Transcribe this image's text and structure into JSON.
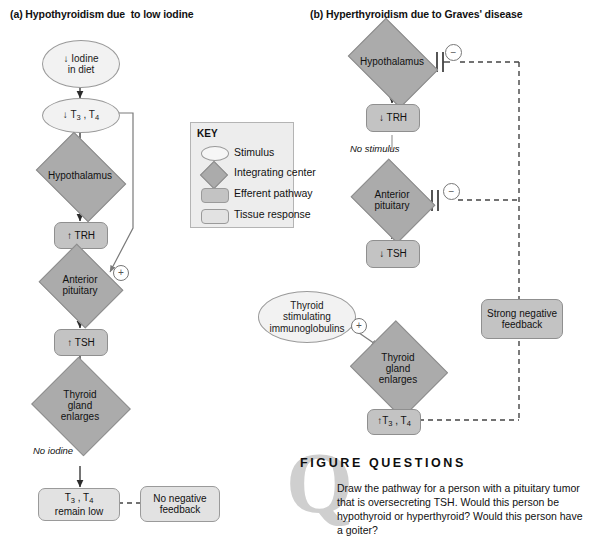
{
  "figure": {
    "panel_a_title": "(a) Hypothyroidism due  to low iodine",
    "panel_b_title": "(b) Hyperthyroidism due to Graves' disease"
  },
  "key": {
    "title": "KEY",
    "items": [
      {
        "shape": "ellipse",
        "label": "Stimulus"
      },
      {
        "shape": "diamond",
        "label": "Integrating center"
      },
      {
        "shape": "rounded-rect-dark",
        "label": "Efferent pathway"
      },
      {
        "shape": "rounded-rect-light",
        "label": "Tissue response"
      }
    ]
  },
  "panel_a": {
    "nodes": [
      {
        "name": "iodine-in-diet",
        "type": "stimulus",
        "line1": "↓ Iodine",
        "line2": "in diet"
      },
      {
        "name": "low-t3-t4",
        "type": "stimulus",
        "text": "↓ T3 , T4"
      },
      {
        "name": "hypothalamus",
        "type": "integrating",
        "text": "Hypothalamus"
      },
      {
        "name": "trh-up",
        "type": "efferent",
        "text": "↑ TRH"
      },
      {
        "name": "anterior-pituitary",
        "type": "integrating",
        "line1": "Anterior",
        "line2": "pituitary"
      },
      {
        "name": "tsh-up",
        "type": "efferent",
        "text": "↑ TSH"
      },
      {
        "name": "thyroid-gland-enlarges",
        "type": "integrating",
        "line1": "Thyroid",
        "line2": "gland",
        "line3": "enlarges"
      },
      {
        "name": "t3-t4-remain-low",
        "type": "response",
        "line1": "T3 , T4",
        "line2": "remain low"
      },
      {
        "name": "no-negative-feedback",
        "type": "response",
        "line1": "No negative",
        "line2": "feedback"
      }
    ],
    "annotations": {
      "no_iodine": "No iodine",
      "plus_sign": "+"
    }
  },
  "panel_b": {
    "nodes": [
      {
        "name": "hypothalamus",
        "type": "integrating",
        "text": "Hypothalamus"
      },
      {
        "name": "trh-down",
        "type": "efferent",
        "text": "↓ TRH"
      },
      {
        "name": "anterior-pituitary",
        "type": "integrating",
        "line1": "Anterior",
        "line2": "pituitary"
      },
      {
        "name": "tsh-down",
        "type": "efferent",
        "text": "↓ TSH"
      },
      {
        "name": "thyroid-stimulating-immunoglobulins",
        "type": "stimulus",
        "line1": "Thyroid",
        "line2": "stimulating",
        "line3": "immunoglobulins"
      },
      {
        "name": "thyroid-gland-enlarges",
        "type": "integrating",
        "line1": "Thyroid",
        "line2": "gland",
        "line3": "enlarges"
      },
      {
        "name": "t3-t4-up",
        "type": "efferent",
        "text": "↑ T3 , T4"
      },
      {
        "name": "strong-negative-feedback",
        "type": "efferent",
        "line1": "Strong negative",
        "line2": "feedback"
      }
    ],
    "annotations": {
      "no_stimulus": "No stimulus",
      "plus_sign": "+",
      "minus_sign": "−"
    }
  },
  "figure_questions": {
    "heading": "FIGURE QUESTIONS",
    "watermark": "Q",
    "body": "Draw the pathway for a person with a pituitary tumor that is oversecreting TSH. Would this person be hypothyroid or hyperthyroid? Would this person have a goiter?"
  },
  "colors": {
    "stimulus_fill": "#f2f2f2",
    "integrating_fill": "#ababab",
    "efferent_fill": "#c3c3c3",
    "response_fill": "#e2e2e2",
    "key_bg": "#ededed",
    "watermark": "#cfcfcf",
    "line": "#333333"
  }
}
